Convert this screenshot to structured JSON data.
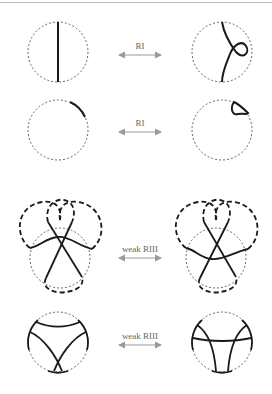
{
  "figure": {
    "rows": [
      {
        "id": "row-1",
        "move_label": "RI",
        "description": "straight strand vs. strand with kink loop"
      },
      {
        "id": "row-2",
        "move_label": "RI",
        "description": "boundary arc vs. small boundary loop"
      },
      {
        "id": "row-3",
        "move_label": "weak RIII",
        "description": "three strands with dashed closure, strand passes above vs. below crossing"
      },
      {
        "id": "row-4",
        "move_label": "weak RIII",
        "description": "disk tangle with crossing arcs vs. arcs and horizontal strand"
      }
    ],
    "caption": "",
    "colors": {
      "stroke": "#1a1a1a",
      "dashed_circle": "#555555",
      "arrow": "#9a9a9a",
      "label": "#666666",
      "top_rule": "#bdbdbd"
    }
  }
}
